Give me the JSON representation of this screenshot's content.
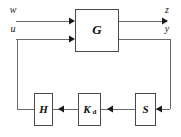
{
  "figure": {
    "kind": "control-block-diagram",
    "width": 181,
    "height": 137,
    "background_color": "#ffffff",
    "line_color": "#6b6b6b",
    "box_border_color": "#4a4a4a",
    "text_color": "#111111"
  },
  "blocks": {
    "plant": {
      "label": "G",
      "subscript": ""
    },
    "h": {
      "label": "H",
      "subscript": ""
    },
    "kd": {
      "label": "K",
      "subscript": "d"
    },
    "s": {
      "label": "S",
      "subscript": ""
    }
  },
  "signals": {
    "w": {
      "label": "w"
    },
    "u": {
      "label": "u"
    },
    "z": {
      "label": "z"
    },
    "y": {
      "label": "y"
    }
  }
}
